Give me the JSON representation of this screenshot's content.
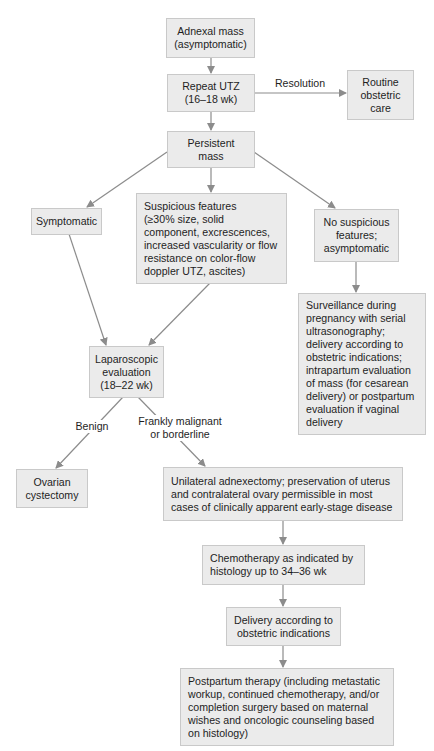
{
  "diagram": {
    "type": "flowchart",
    "topic": "Management of adnexal mass in pregnancy",
    "colors": {
      "box_fill": "#ebebeb",
      "box_border": "#c9c9c9",
      "arrow": "#8c8c8c",
      "text": "#1e1e1e"
    },
    "nodes": {
      "adnexal_mass": "Adnexal mass\n(asymptomatic)",
      "repeat_utz": "Repeat UTZ\n(16–18 wk)",
      "routine_care": "Routine\nobstetric\ncare",
      "persistent_mass": "Persistent\nmass",
      "symptomatic": "Symptomatic",
      "suspicious": "Suspicious features\n(≥30% size, solid\ncomponent, excrescences,\nincreased vascularity or flow\nresistance on color-flow\ndoppler UTZ, ascites)",
      "no_suspicious": "No suspicious\nfeatures;\nasymptomatic",
      "surveillance": "Surveillance during\npregnancy with serial\nultrasonography;\ndelivery according to\nobstetric indications;\nintrapartum evaluation\nof mass (for cesarean\ndelivery) or postpartum\nevaluation if vaginal\ndelivery",
      "laparoscopic": "Laparoscopic\nevaluation\n(18–22 wk)",
      "ovarian_cystectomy": "Ovarian\ncystectomy",
      "adnexectomy": "Unilateral adnexectomy; preservation of uterus\nand contralateral ovary permissible in most\ncases of clinically apparent early-stage disease",
      "chemotherapy": "Chemotherapy as indicated by\nhistology up to 34–36 wk",
      "delivery": "Delivery according to\nobstetric indications",
      "postpartum": "Postpartum therapy (including metastatic\nworkup, continued chemotherapy, and/or\ncompletion surgery based on maternal\nwishes and oncologic counseling based\non histology)"
    },
    "edge_labels": {
      "resolution": "Resolution",
      "benign": "Benign",
      "malignant": "Frankly malignant\nor borderline"
    },
    "edges": [
      {
        "from": "adnexal_mass",
        "to": "repeat_utz"
      },
      {
        "from": "repeat_utz",
        "to": "routine_care",
        "label": "Resolution"
      },
      {
        "from": "repeat_utz",
        "to": "persistent_mass"
      },
      {
        "from": "persistent_mass",
        "to": "symptomatic"
      },
      {
        "from": "persistent_mass",
        "to": "suspicious"
      },
      {
        "from": "persistent_mass",
        "to": "no_suspicious"
      },
      {
        "from": "no_suspicious",
        "to": "surveillance"
      },
      {
        "from": "symptomatic",
        "to": "laparoscopic"
      },
      {
        "from": "suspicious",
        "to": "laparoscopic"
      },
      {
        "from": "laparoscopic",
        "to": "ovarian_cystectomy",
        "label": "Benign"
      },
      {
        "from": "laparoscopic",
        "to": "adnexectomy",
        "label": "Frankly malignant or borderline"
      },
      {
        "from": "adnexectomy",
        "to": "chemotherapy"
      },
      {
        "from": "chemotherapy",
        "to": "delivery"
      },
      {
        "from": "delivery",
        "to": "postpartum"
      }
    ]
  }
}
